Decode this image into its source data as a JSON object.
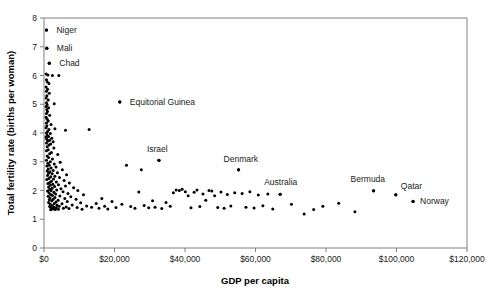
{
  "chart_data": {
    "type": "scatter",
    "title": "",
    "xlabel": "GDP per capita",
    "ylabel": "Total fertility rate (births per woman)",
    "xlim": [
      0,
      120000
    ],
    "ylim": [
      0,
      8
    ],
    "xticks": [
      0,
      20000,
      40000,
      60000,
      80000,
      100000,
      120000
    ],
    "xtick_labels": [
      "$0",
      "$20,000",
      "$40,000",
      "$60,000",
      "$80,000",
      "$100,000",
      "$120,000"
    ],
    "yticks": [
      0,
      1,
      2,
      3,
      4,
      5,
      6,
      7,
      8
    ],
    "ytick_labels": [
      "0",
      "1",
      "2",
      "3",
      "4",
      "5",
      "6",
      "7",
      "8"
    ],
    "grid": false,
    "legend": false,
    "marker_color": "#000000",
    "annotations": [
      {
        "label": "Niger",
        "x": 700,
        "y": 7.58,
        "label_dx": 10,
        "label_dy": 3
      },
      {
        "label": "Mali",
        "x": 800,
        "y": 6.95,
        "label_dx": 10,
        "label_dy": 3
      },
      {
        "label": "Chad",
        "x": 1500,
        "y": 6.43,
        "label_dx": 10,
        "label_dy": 3
      },
      {
        "label": "Equitorial Guinea",
        "x": 21500,
        "y": 5.08,
        "label_dx": 10,
        "label_dy": 3
      },
      {
        "label": "Israel",
        "x": 32600,
        "y": 3.05,
        "label_dx": -12,
        "label_dy": -8
      },
      {
        "label": "Denmark",
        "x": 55200,
        "y": 2.72,
        "label_dx": -15,
        "label_dy": -8
      },
      {
        "label": "Australia",
        "x": 67000,
        "y": 1.87,
        "label_dx": -16,
        "label_dy": -9
      },
      {
        "label": "Bermuda",
        "x": 93500,
        "y": 1.99,
        "label_dx": -23,
        "label_dy": -9
      },
      {
        "label": "Qatar",
        "x": 99800,
        "y": 1.85,
        "label_dx": 5,
        "label_dy": -6
      },
      {
        "label": "Norway",
        "x": 104700,
        "y": 1.62,
        "label_dx": 7,
        "label_dy": 3
      }
    ],
    "points": [
      [
        700,
        7.58
      ],
      [
        800,
        6.95
      ],
      [
        1500,
        6.43
      ],
      [
        600,
        6.05
      ],
      [
        1100,
        6.02
      ],
      [
        2400,
        6.0
      ],
      [
        4200,
        6.0
      ],
      [
        700,
        5.85
      ],
      [
        900,
        5.78
      ],
      [
        1400,
        5.72
      ],
      [
        600,
        5.6
      ],
      [
        1000,
        5.52
      ],
      [
        700,
        5.45
      ],
      [
        1500,
        5.38
      ],
      [
        800,
        5.3
      ],
      [
        600,
        5.22
      ],
      [
        1200,
        5.15
      ],
      [
        2900,
        5.02
      ],
      [
        700,
        5.05
      ],
      [
        900,
        4.98
      ],
      [
        600,
        4.92
      ],
      [
        1300,
        4.88
      ],
      [
        800,
        4.82
      ],
      [
        1000,
        4.75
      ],
      [
        700,
        4.68
      ],
      [
        1600,
        4.62
      ],
      [
        600,
        4.55
      ],
      [
        900,
        4.48
      ],
      [
        1200,
        4.42
      ],
      [
        700,
        4.35
      ],
      [
        2000,
        4.3
      ],
      [
        800,
        4.25
      ],
      [
        600,
        4.18
      ],
      [
        1400,
        4.12
      ],
      [
        3100,
        4.15
      ],
      [
        1000,
        4.05
      ],
      [
        700,
        4.0
      ],
      [
        1800,
        3.98
      ],
      [
        6100,
        4.1
      ],
      [
        12800,
        4.12
      ],
      [
        900,
        3.92
      ],
      [
        1300,
        3.88
      ],
      [
        600,
        3.85
      ],
      [
        2200,
        3.82
      ],
      [
        800,
        3.78
      ],
      [
        1600,
        3.75
      ],
      [
        1100,
        3.72
      ],
      [
        2600,
        3.7
      ],
      [
        700,
        3.65
      ],
      [
        1900,
        3.62
      ],
      [
        1400,
        3.58
      ],
      [
        900,
        3.52
      ],
      [
        2800,
        3.48
      ],
      [
        1200,
        3.42
      ],
      [
        700,
        3.38
      ],
      [
        2100,
        3.32
      ],
      [
        1600,
        3.28
      ],
      [
        3900,
        3.25
      ],
      [
        900,
        3.2
      ],
      [
        1300,
        3.15
      ],
      [
        2400,
        3.1
      ],
      [
        700,
        3.05
      ],
      [
        1800,
        3.0
      ],
      [
        4600,
        2.98
      ],
      [
        1100,
        2.95
      ],
      [
        2900,
        2.92
      ],
      [
        1500,
        2.88
      ],
      [
        800,
        2.85
      ],
      [
        3400,
        2.82
      ],
      [
        2000,
        2.78
      ],
      [
        1200,
        2.75
      ],
      [
        5200,
        2.72
      ],
      [
        2600,
        2.7
      ],
      [
        900,
        2.68
      ],
      [
        1700,
        2.65
      ],
      [
        3800,
        2.62
      ],
      [
        1300,
        2.6
      ],
      [
        2300,
        2.58
      ],
      [
        6400,
        2.55
      ],
      [
        1000,
        2.52
      ],
      [
        3100,
        2.5
      ],
      [
        1900,
        2.48
      ],
      [
        4400,
        2.45
      ],
      [
        1400,
        2.42
      ],
      [
        2700,
        2.4
      ],
      [
        800,
        2.38
      ],
      [
        5700,
        2.35
      ],
      [
        2100,
        2.32
      ],
      [
        3500,
        2.3
      ],
      [
        1600,
        2.28
      ],
      [
        7200,
        2.26
      ],
      [
        1100,
        2.24
      ],
      [
        2500,
        2.22
      ],
      [
        4100,
        2.2
      ],
      [
        1800,
        2.18
      ],
      [
        6100,
        2.16
      ],
      [
        3000,
        2.14
      ],
      [
        1300,
        2.12
      ],
      [
        8400,
        2.1
      ],
      [
        2300,
        2.08
      ],
      [
        4800,
        2.06
      ],
      [
        1600,
        2.04
      ],
      [
        3600,
        2.02
      ],
      [
        2000,
        2.0
      ],
      [
        9600,
        2.0
      ],
      [
        1000,
        1.98
      ],
      [
        5400,
        1.96
      ],
      [
        2800,
        1.94
      ],
      [
        1400,
        1.92
      ],
      [
        6800,
        1.9
      ],
      [
        3300,
        1.88
      ],
      [
        1900,
        1.86
      ],
      [
        11200,
        1.85
      ],
      [
        2400,
        1.83
      ],
      [
        4500,
        1.81
      ],
      [
        1200,
        1.8
      ],
      [
        7600,
        1.78
      ],
      [
        3100,
        1.76
      ],
      [
        1700,
        1.74
      ],
      [
        5900,
        1.72
      ],
      [
        2600,
        1.7
      ],
      [
        9100,
        1.7
      ],
      [
        1500,
        1.68
      ],
      [
        4000,
        1.66
      ],
      [
        2200,
        1.64
      ],
      [
        6600,
        1.62
      ],
      [
        3400,
        1.6
      ],
      [
        1300,
        1.58
      ],
      [
        10400,
        1.57
      ],
      [
        2900,
        1.55
      ],
      [
        5100,
        1.54
      ],
      [
        1800,
        1.52
      ],
      [
        8000,
        1.5
      ],
      [
        3700,
        1.49
      ],
      [
        2400,
        1.47
      ],
      [
        12100,
        1.46
      ],
      [
        4300,
        1.45
      ],
      [
        1600,
        1.44
      ],
      [
        6300,
        1.43
      ],
      [
        2800,
        1.42
      ],
      [
        9400,
        1.41
      ],
      [
        3500,
        1.4
      ],
      [
        2000,
        1.39
      ],
      [
        5500,
        1.38
      ],
      [
        7100,
        1.37
      ],
      [
        2600,
        1.36
      ],
      [
        4100,
        1.35
      ],
      [
        10800,
        1.35
      ],
      [
        3200,
        1.34
      ],
      [
        1900,
        1.33
      ],
      [
        13500,
        1.42
      ],
      [
        14800,
        1.55
      ],
      [
        15600,
        1.38
      ],
      [
        16400,
        1.72
      ],
      [
        17200,
        1.45
      ],
      [
        18100,
        1.36
      ],
      [
        19300,
        1.62
      ],
      [
        20400,
        1.41
      ],
      [
        21500,
        5.08
      ],
      [
        22100,
        1.52
      ],
      [
        23400,
        2.88
      ],
      [
        24600,
        1.44
      ],
      [
        25800,
        1.38
      ],
      [
        26900,
        1.95
      ],
      [
        27600,
        2.72
      ],
      [
        28400,
        1.48
      ],
      [
        29700,
        1.4
      ],
      [
        30800,
        1.64
      ],
      [
        31500,
        1.42
      ],
      [
        32600,
        3.05
      ],
      [
        33400,
        1.37
      ],
      [
        34600,
        1.58
      ],
      [
        35800,
        1.45
      ],
      [
        36700,
        1.92
      ],
      [
        37500,
        2.02
      ],
      [
        38400,
        2.0
      ],
      [
        39200,
        2.04
      ],
      [
        40100,
        1.96
      ],
      [
        40900,
        1.82
      ],
      [
        41700,
        1.4
      ],
      [
        42600,
        1.94
      ],
      [
        43400,
        2.02
      ],
      [
        44200,
        1.44
      ],
      [
        45100,
        1.88
      ],
      [
        45900,
        1.66
      ],
      [
        46800,
        2.0
      ],
      [
        47600,
        1.98
      ],
      [
        48400,
        1.82
      ],
      [
        49300,
        1.41
      ],
      [
        50200,
        1.95
      ],
      [
        51100,
        1.38
      ],
      [
        52000,
        1.86
      ],
      [
        53000,
        1.46
      ],
      [
        54100,
        1.92
      ],
      [
        55200,
        2.72
      ],
      [
        56200,
        1.9
      ],
      [
        57300,
        1.42
      ],
      [
        58400,
        1.96
      ],
      [
        59600,
        1.39
      ],
      [
        60800,
        1.84
      ],
      [
        62100,
        1.47
      ],
      [
        63500,
        1.88
      ],
      [
        64900,
        1.36
      ],
      [
        67000,
        1.87
      ],
      [
        70200,
        1.52
      ],
      [
        73800,
        1.18
      ],
      [
        76500,
        1.34
      ],
      [
        79100,
        1.45
      ],
      [
        83600,
        1.56
      ],
      [
        88200,
        1.26
      ],
      [
        93500,
        1.99
      ],
      [
        99800,
        1.85
      ],
      [
        104700,
        1.62
      ]
    ]
  }
}
